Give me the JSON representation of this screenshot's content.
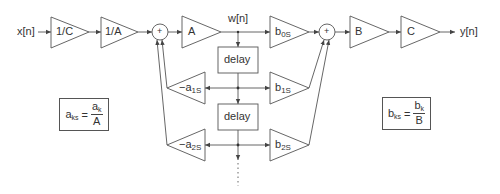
{
  "diagram": {
    "type": "signal-flow block diagram (scaled direct form II biquad)",
    "colors": {
      "stroke": "#555555",
      "text": "#333333",
      "background": "#ffffff"
    },
    "signals": {
      "input": "x[n]",
      "internal": "w[n]",
      "output": "y[n]"
    },
    "input_chain": [
      {
        "id": "gain-1-over-c",
        "label": "1/C"
      },
      {
        "id": "gain-1-over-a",
        "label": "1/A"
      }
    ],
    "summing_junctions": [
      {
        "id": "sum-feedback",
        "symbol": "+"
      },
      {
        "id": "sum-feedforward",
        "symbol": "+"
      }
    ],
    "forward_gain": {
      "id": "gain-a",
      "label": "A"
    },
    "delays": [
      {
        "id": "delay-1",
        "label": "delay"
      },
      {
        "id": "delay-2",
        "label": "delay"
      }
    ],
    "feedback_gains": [
      {
        "id": "gain-neg-a1s",
        "prefix": "−a",
        "sub": "1S"
      },
      {
        "id": "gain-neg-a2s",
        "prefix": "−a",
        "sub": "2S"
      }
    ],
    "feedforward_gains": [
      {
        "id": "gain-b0s",
        "prefix": "b",
        "sub": "0S"
      },
      {
        "id": "gain-b1s",
        "prefix": "b",
        "sub": "1S"
      },
      {
        "id": "gain-b2s",
        "prefix": "b",
        "sub": "2S"
      }
    ],
    "output_chain": [
      {
        "id": "gain-b",
        "label": "B"
      },
      {
        "id": "gain-c",
        "label": "C"
      }
    ],
    "equations": [
      {
        "id": "eq-a",
        "lhs_base": "a",
        "lhs_sub": "ks",
        "equals": "=",
        "num_base": "a",
        "num_sub": "k",
        "den": "A"
      },
      {
        "id": "eq-b",
        "lhs_base": "b",
        "lhs_sub": "ks",
        "equals": "=",
        "num_base": "b",
        "num_sub": "k",
        "den": "B"
      }
    ],
    "continuation": "⋮"
  }
}
